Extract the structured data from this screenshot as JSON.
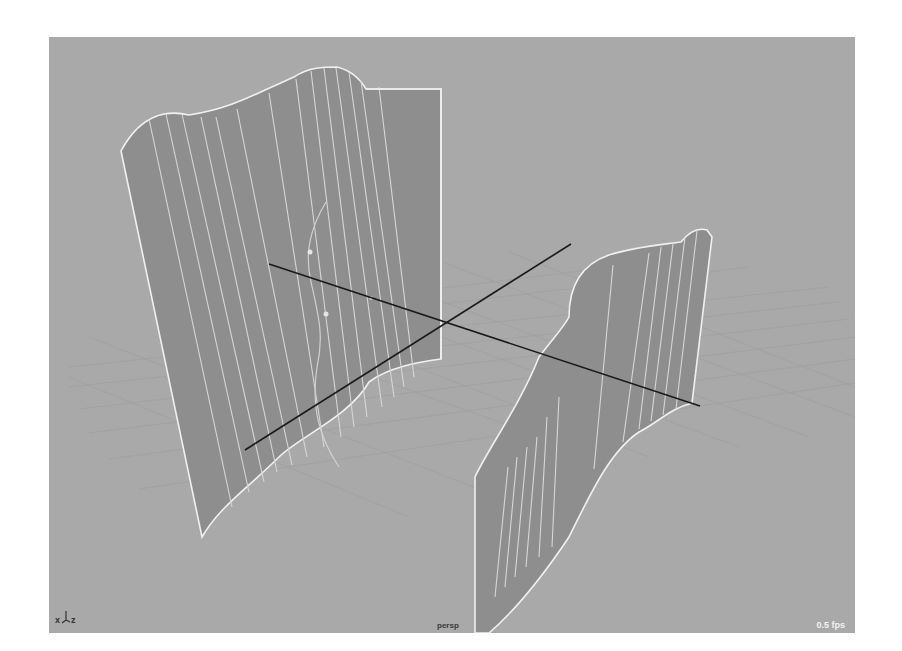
{
  "viewport": {
    "camera": "persp",
    "fps": "0.5 fps",
    "axis_gizmo": {
      "x_label": "x",
      "z_label": "z"
    },
    "colors": {
      "background": "#a9a9a9",
      "grid": "#9c9c9c",
      "surface_fill": "#8e8e8e",
      "isoparm": "#d8d8d8",
      "surface_border": "#f0f0f0",
      "axis_line": "#1a1a1a"
    },
    "objects": [
      {
        "name": "nurbs-surface-left",
        "type": "extruded-surface"
      },
      {
        "name": "nurbs-surface-right",
        "type": "extruded-surface"
      },
      {
        "name": "profile-curve",
        "type": "curve"
      },
      {
        "name": "axis-line-x",
        "type": "line"
      },
      {
        "name": "axis-line-z",
        "type": "line"
      }
    ]
  }
}
